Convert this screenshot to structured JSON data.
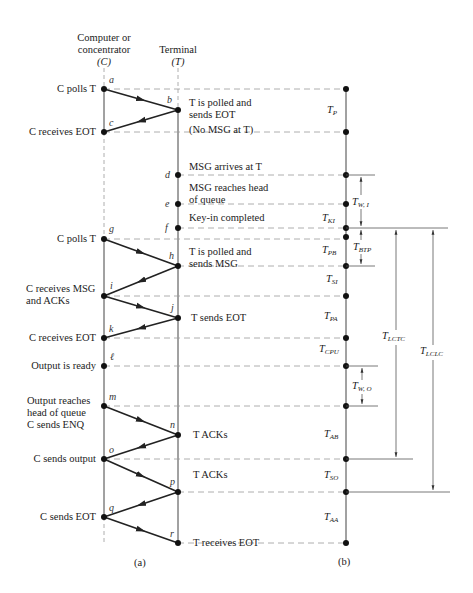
{
  "columns": {
    "computer": {
      "line1": "Computer or",
      "line2": "concentrator",
      "symbol": "(C)"
    },
    "terminal": {
      "line1": "Terminal",
      "symbol": "(T)"
    }
  },
  "left_labels": [
    {
      "id": "a",
      "text": "C polls T"
    },
    {
      "id": "c",
      "text": "C receives EOT"
    },
    {
      "id": "g",
      "text": "C polls T"
    },
    {
      "id": "i",
      "line1": "C receives MSG",
      "line2": "and ACKs"
    },
    {
      "id": "k",
      "text": "C receives EOT"
    },
    {
      "id": "l",
      "text": "Output is ready"
    },
    {
      "id": "m",
      "line1": "Output reaches",
      "line2": "head of queue",
      "line3": "C sends ENQ"
    },
    {
      "id": "o",
      "text": "C sends output"
    },
    {
      "id": "q",
      "text": "C sends EOT"
    }
  ],
  "right_labels": [
    {
      "id": "b",
      "line1": "T is polled and",
      "line2": "sends EOT",
      "line3": "(No MSG at T)"
    },
    {
      "id": "d",
      "text": "MSG arrives at T"
    },
    {
      "id": "e",
      "line1": "MSG reaches head",
      "line2": "of queue"
    },
    {
      "id": "f",
      "text": "Key-in completed"
    },
    {
      "id": "h",
      "line1": "T is polled and",
      "line2": "sends MSG"
    },
    {
      "id": "j",
      "text": "T sends EOT"
    },
    {
      "id": "n",
      "text": "T ACKs"
    },
    {
      "id": "p",
      "text": "T ACKs"
    },
    {
      "id": "r",
      "text": "T receives EOT"
    }
  ],
  "points": [
    "a",
    "b",
    "c",
    "d",
    "e",
    "f",
    "g",
    "h",
    "i",
    "j",
    "k",
    "ℓ",
    "m",
    "n",
    "o",
    "p",
    "q",
    "r"
  ],
  "intervals": [
    {
      "main": "T",
      "sub": "P"
    },
    {
      "main": "T",
      "sub": "W, I"
    },
    {
      "main": "T",
      "sub": "KI"
    },
    {
      "main": "T",
      "sub": "BTP"
    },
    {
      "main": "T",
      "sub": "PB"
    },
    {
      "main": "T",
      "sub": "SI"
    },
    {
      "main": "T",
      "sub": "PA"
    },
    {
      "main": "T",
      "sub": "CPU"
    },
    {
      "main": "T",
      "sub": "W, O"
    },
    {
      "main": "T",
      "sub": "AB"
    },
    {
      "main": "T",
      "sub": "SO"
    },
    {
      "main": "T",
      "sub": "AA"
    },
    {
      "main": "T",
      "sub": "LCTC"
    },
    {
      "main": "T",
      "sub": "LCLC"
    }
  ],
  "captions": {
    "a": "(a)",
    "b": "(b)"
  }
}
